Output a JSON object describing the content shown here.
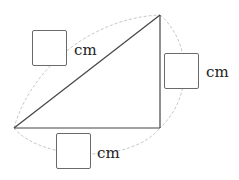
{
  "diagram": {
    "type": "right-triangle-with-arcs",
    "labels": {
      "hypotenuse": {
        "value": "",
        "unit": "cm"
      },
      "vertical_side": {
        "value": "",
        "unit": "cm"
      },
      "base": {
        "value": "",
        "unit": "cm"
      }
    },
    "colors": {
      "lines": "#444444",
      "arcs": "#c8c8c8",
      "box_border": "#6a6a6a"
    }
  }
}
